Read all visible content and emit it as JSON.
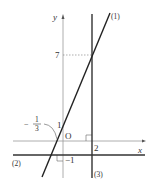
{
  "diagram": {
    "type": "coordinate-plane-graph",
    "axes": {
      "x_label": "x",
      "y_label": "y",
      "origin_label": "O"
    },
    "lines": [
      {
        "id": "(1)",
        "label": "(1)",
        "equation": "y = 3x + 1"
      },
      {
        "id": "(2)",
        "label": "(2)",
        "equation": "y = -1"
      },
      {
        "id": "(3)",
        "label": "(3)",
        "equation": "x = 2"
      }
    ],
    "tick_labels": {
      "y_seven": "7",
      "y_one": "1",
      "y_minus_one": "−1",
      "x_two": "2",
      "x_intercept_num": "1",
      "x_intercept_den": "3",
      "x_intercept_sign": "−"
    },
    "colors": {
      "axis": "#888888",
      "line": "#222222",
      "text": "#333333"
    }
  }
}
